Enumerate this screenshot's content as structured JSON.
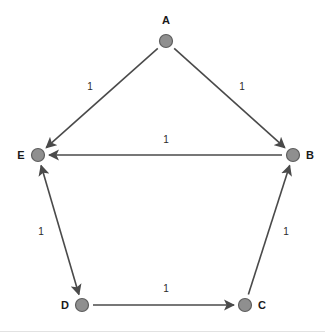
{
  "figure": {
    "width": 325,
    "height": 335,
    "background": "#ffffff"
  },
  "style": {
    "node_fill": "#8f8f8f",
    "node_stroke": "#5e5e5e",
    "edge_color": "#4a4a4a",
    "label_color": "#1a1a1a",
    "weight_color": "#2b2b2b"
  },
  "graph": {
    "nodes": [
      {
        "id": "A",
        "label": "A",
        "x": 166,
        "y": 41,
        "label_x": 166,
        "label_y": 24,
        "label_anchor": "middle"
      },
      {
        "id": "B",
        "label": "B",
        "x": 293,
        "y": 155,
        "label_x": 310,
        "label_y": 159,
        "label_anchor": "middle"
      },
      {
        "id": "C",
        "label": "C",
        "x": 245,
        "y": 305,
        "label_x": 262,
        "label_y": 309,
        "label_anchor": "middle"
      },
      {
        "id": "D",
        "label": "D",
        "x": 82,
        "y": 305,
        "label_x": 65,
        "label_y": 309,
        "label_anchor": "middle"
      },
      {
        "id": "E",
        "label": "E",
        "x": 38,
        "y": 155,
        "label_x": 21,
        "label_y": 159,
        "label_anchor": "middle"
      }
    ],
    "edges": [
      {
        "id": "A-E",
        "from": "A",
        "to": "E",
        "weight": "1",
        "arrows": "end",
        "label_x": 90,
        "label_y": 90
      },
      {
        "id": "A-B",
        "from": "A",
        "to": "B",
        "weight": "1",
        "arrows": "end",
        "label_x": 242,
        "label_y": 90
      },
      {
        "id": "B-E",
        "from": "B",
        "to": "E",
        "weight": "1",
        "arrows": "end",
        "label_x": 166,
        "label_y": 143
      },
      {
        "id": "E-D",
        "from": "E",
        "to": "D",
        "weight": "1",
        "arrows": "both",
        "label_x": 41,
        "label_y": 235
      },
      {
        "id": "D-C",
        "from": "D",
        "to": "C",
        "weight": "1",
        "arrows": "end",
        "label_x": 166,
        "label_y": 292
      },
      {
        "id": "C-B",
        "from": "C",
        "to": "B",
        "weight": "1",
        "arrows": "end",
        "label_x": 286,
        "label_y": 235
      }
    ]
  }
}
